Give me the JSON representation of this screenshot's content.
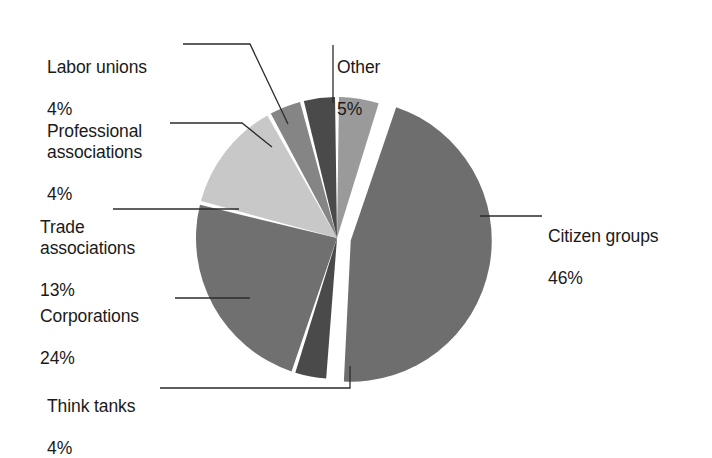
{
  "chart_data": {
    "type": "pie",
    "title": "",
    "subtitle": "",
    "xlabel": "",
    "ylabel": "",
    "legend_position": "callout-labels",
    "grid": false,
    "units": "percent",
    "categories": [
      "Other",
      "Citizen groups",
      "Think tanks",
      "Corporations",
      "Trade associations",
      "Professional associations",
      "Labor unions"
    ],
    "values": [
      5,
      46,
      4,
      24,
      13,
      4,
      4
    ],
    "slices": [
      {
        "label": "Other",
        "value": 5,
        "value_text": "5%",
        "color": "#9a9a9a",
        "exploded": false
      },
      {
        "label": "Citizen groups",
        "value": 46,
        "value_text": "46%",
        "color": "#6e6e6e",
        "exploded": true
      },
      {
        "label": "Think tanks",
        "value": 4,
        "value_text": "4%",
        "color": "#4a4a4a",
        "exploded": false
      },
      {
        "label": "Corporations",
        "value": 24,
        "value_text": "24%",
        "color": "#707070",
        "exploded": false
      },
      {
        "label": "Trade associations",
        "value": 13,
        "value_text": "13%",
        "color": "#c8c8c8",
        "exploded": false
      },
      {
        "label": "Professional associations",
        "value": 4,
        "value_text": "4%",
        "color": "#858585",
        "exploded": false
      },
      {
        "label": "Labor unions",
        "value": 4,
        "value_text": "4%",
        "color": "#4a4a4a",
        "exploded": false
      }
    ]
  },
  "labels": {
    "labor_unions": {
      "category": "Labor unions",
      "value": "4%"
    },
    "professional": {
      "category": "Professional\nassociations",
      "value": "4%"
    },
    "trade": {
      "category": "Trade\nassociations",
      "value": "13%"
    },
    "corporations": {
      "category": "Corporations",
      "value": "24%"
    },
    "think_tanks": {
      "category": "Think tanks",
      "value": "4%"
    },
    "other": {
      "category": "Other",
      "value": "5%"
    },
    "citizen_groups": {
      "category": "Citizen groups",
      "value": "46%"
    }
  },
  "style": {
    "background": "#ffffff",
    "text_color": "#1a1a1a",
    "leader_line_color": "#2b2b2b",
    "slice_gap_color": "#ffffff"
  }
}
